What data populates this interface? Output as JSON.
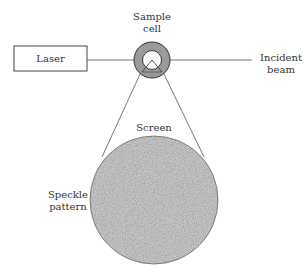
{
  "diagram": {
    "labels": {
      "laser": "Laser",
      "sample_cell_line1": "Sample",
      "sample_cell_line2": "cell",
      "incident_line1": "Incident",
      "incident_line2": "beam",
      "screen": "Screen",
      "speckle_line1": "Speckle",
      "speckle_line2": "pattern"
    },
    "colors": {
      "line": "#555555",
      "ring": "#9a9a9a",
      "speckle_base": "#a8a8a8"
    }
  }
}
